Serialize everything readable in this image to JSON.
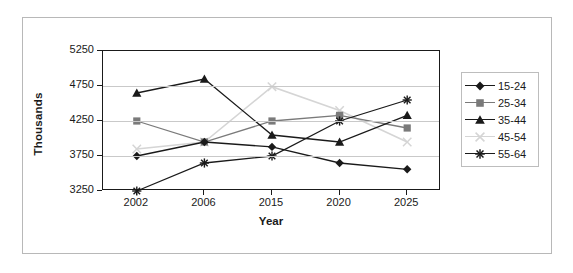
{
  "chart_data": {
    "type": "line",
    "title": "",
    "xlabel": "Year",
    "ylabel": "Thousands",
    "categories": [
      "2002",
      "2006",
      "2015",
      "2020",
      "2025"
    ],
    "yticks": [
      3250,
      3750,
      4250,
      4750,
      5250
    ],
    "ylim": [
      3250,
      5250
    ],
    "grid": true,
    "legend_position": "right",
    "series": [
      {
        "name": "15-24",
        "marker": "diamond",
        "color": "#1a1a1a",
        "values": [
          3750,
          3950,
          3880,
          3650,
          3560
        ]
      },
      {
        "name": "25-34",
        "marker": "square",
        "color": "#7a7a7a",
        "values": [
          4250,
          3950,
          4250,
          4330,
          4150
        ]
      },
      {
        "name": "35-44",
        "marker": "triangle",
        "color": "#1a1a1a",
        "values": [
          4650,
          4850,
          4050,
          3950,
          4330
        ]
      },
      {
        "name": "45-54",
        "marker": "x",
        "color": "#d5d5d5",
        "values": [
          3850,
          3950,
          4740,
          4400,
          3950
        ]
      },
      {
        "name": "55-64",
        "marker": "asterisk",
        "color": "#1a1a1a",
        "values": [
          3250,
          3650,
          3750,
          4250,
          4550
        ]
      }
    ]
  },
  "axis": {
    "y_title": "Thousands",
    "x_title": "Year"
  }
}
